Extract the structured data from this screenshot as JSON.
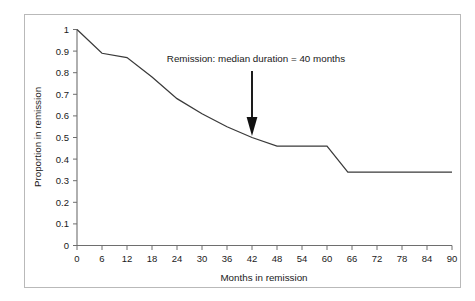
{
  "figure": {
    "background_color": "#ffffff",
    "frame_color": "#b9b9b9",
    "axis_color": "#6e6e6e",
    "line_color": "#3a3a3a",
    "arrow_color": "#111111",
    "text_color": "#1a1a1a"
  },
  "chart_data": {
    "type": "line",
    "title": "",
    "subtitle": "",
    "xlabel": "Months in remission",
    "ylabel": "Proportion in remission",
    "xlim": [
      0,
      90
    ],
    "ylim": [
      0,
      1
    ],
    "grid": false,
    "legend": null,
    "legend_position": "none",
    "x_ticks": [
      0,
      6,
      12,
      18,
      24,
      30,
      36,
      42,
      48,
      54,
      60,
      66,
      72,
      78,
      84,
      90
    ],
    "x_tick_labels": [
      "0",
      "6",
      "12",
      "18",
      "24",
      "30",
      "36",
      "42",
      "48",
      "54",
      "60",
      "66",
      "72",
      "78",
      "84",
      "90"
    ],
    "y_ticks": [
      0,
      0.1,
      0.2,
      0.3,
      0.4,
      0.5,
      0.6,
      0.7,
      0.8,
      0.9,
      1
    ],
    "y_tick_labels": [
      "0",
      "0.1",
      "0.2",
      "0.3",
      "0.4",
      "0.5",
      "0.6",
      "0.7",
      "0.8",
      "0.9",
      "1"
    ],
    "series": [
      {
        "name": "Proportion in remission",
        "x": [
          0,
          6,
          12,
          18,
          24,
          30,
          36,
          42,
          48,
          60,
          65,
          90
        ],
        "values": [
          1.0,
          0.89,
          0.87,
          0.78,
          0.68,
          0.61,
          0.55,
          0.5,
          0.46,
          0.46,
          0.34,
          0.34
        ]
      }
    ],
    "annotations": [
      {
        "name": "median-duration-annotation",
        "text": "Remission: median duration = 40 months",
        "text_x": 43,
        "text_y": 0.855,
        "arrow_x": 42,
        "arrow_y_top": 0.78,
        "arrow_y_tip": 0.5
      }
    ]
  }
}
